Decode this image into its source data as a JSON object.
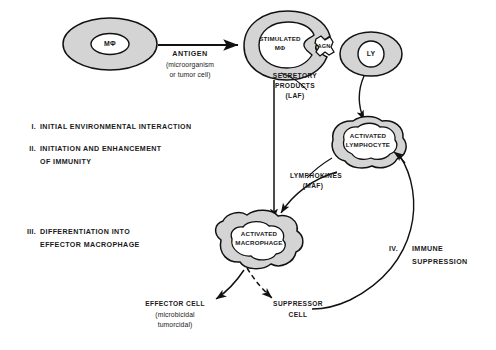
{
  "figure": {
    "background": "#ffffff",
    "cell_fill": "#d4d4d4",
    "line_color": "#111111"
  },
  "cells": {
    "macrophage": {
      "label": "MΦ"
    },
    "stimulated_macrophage": {
      "line1": "STIMULATED",
      "line2": "MΦ"
    },
    "antigen_particle": {
      "label": "AGN"
    },
    "lymphocyte": {
      "label": "LY"
    },
    "activated_lymphocyte": {
      "line1": "ACTIVATED",
      "line2": "LYMPHOCYTE"
    },
    "activated_macrophage": {
      "line1": "ACTIVATED",
      "line2": "MACROPHAGE"
    }
  },
  "labels": {
    "antigen": "ANTIGEN",
    "antigen_sub1": "(microorganism",
    "antigen_sub2": "or tumor cell)",
    "secretory1": "SECRETORY",
    "secretory2": "PRODUCTS",
    "secretory3": "(LAF)",
    "lymphokines1": "LYMPHOKINES",
    "lymphokines2": "(MAF)",
    "effector_cell": "EFFECTOR CELL",
    "effector_sub1": "(microbicidal",
    "effector_sub2": "tumorcidal)",
    "suppressor1": "SUPPRESSOR",
    "suppressor2": "CELL"
  },
  "stages": [
    {
      "numeral": "I.",
      "line1": "INITIAL ENVIRONMENTAL INTERACTION",
      "line2": ""
    },
    {
      "numeral": "II.",
      "line1": "INITIATION AND ENHANCEMENT",
      "line2": "OF IMMUNITY"
    },
    {
      "numeral": "III.",
      "line1": "DIFFERENTIATION INTO",
      "line2": "EFFECTOR MACROPHAGE"
    },
    {
      "numeral": "IV.",
      "line1": "IMMUNE",
      "line2": "SUPPRESSION"
    }
  ]
}
